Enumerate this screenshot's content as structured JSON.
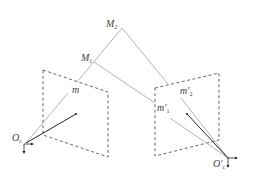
{
  "diagram": {
    "type": "stereo-epipolar-geometry",
    "colors": {
      "ray": "#aaaaaa",
      "axis": "#222222",
      "plane": "#555555",
      "label": "#444444"
    },
    "points": {
      "M2": {
        "label": "M",
        "sub": "2",
        "x": 122,
        "y": 28
      },
      "M1": {
        "label": "M",
        "sub": "1",
        "x": 94,
        "y": 62
      },
      "m": {
        "label": "m",
        "x": 74,
        "y": 90
      },
      "m1p": {
        "label": "m'",
        "sub": "1",
        "x": 160,
        "y": 108
      },
      "m2p": {
        "label": "m'",
        "sub": "2",
        "x": 181,
        "y": 90
      },
      "O_left": {
        "label": "O",
        "sub": "c",
        "x": 26,
        "y": 143
      },
      "O_right": {
        "label": "O'",
        "sub": "c",
        "x": 228,
        "y": 158
      }
    },
    "planes": {
      "left": [
        [
          43,
          70
        ],
        [
          108,
          92
        ],
        [
          108,
          157
        ],
        [
          43,
          135
        ]
      ],
      "right": [
        [
          155,
          88
        ],
        [
          219,
          73
        ],
        [
          219,
          140
        ],
        [
          155,
          156
        ]
      ]
    }
  }
}
